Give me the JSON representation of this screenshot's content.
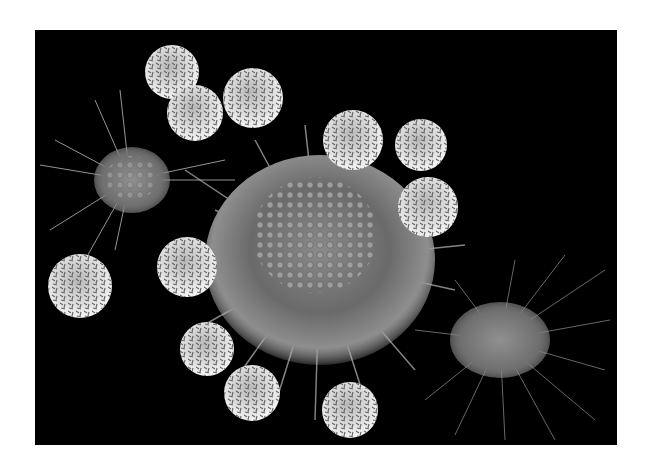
{
  "image": {
    "subject": "scanning electron micrograph of small round spiky cells surrounding a large cell with filopodia",
    "background_color": "#000000",
    "frame_color": "#ffffff"
  },
  "elements": {
    "large_cell": {
      "cx": 285,
      "cy": 230,
      "r": 110
    },
    "left_cell": {
      "cx": 95,
      "cy": 150,
      "r": 40
    },
    "right_cell": {
      "cx": 465,
      "cy": 310,
      "r": 55
    },
    "small_cells": [
      {
        "cx": 137,
        "cy": 42,
        "r": 27
      },
      {
        "cx": 160,
        "cy": 83,
        "r": 28
      },
      {
        "cx": 218,
        "cy": 68,
        "r": 30
      },
      {
        "cx": 318,
        "cy": 110,
        "r": 30
      },
      {
        "cx": 386,
        "cy": 115,
        "r": 26
      },
      {
        "cx": 393,
        "cy": 177,
        "r": 30
      },
      {
        "cx": 152,
        "cy": 237,
        "r": 30
      },
      {
        "cx": 45,
        "cy": 256,
        "r": 32
      },
      {
        "cx": 172,
        "cy": 319,
        "r": 27
      },
      {
        "cx": 217,
        "cy": 363,
        "r": 28
      },
      {
        "cx": 315,
        "cy": 380,
        "r": 28
      }
    ]
  }
}
